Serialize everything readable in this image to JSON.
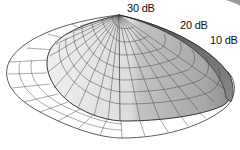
{
  "diagram": {
    "type": "3d-radiation-pattern",
    "labels": [
      {
        "text": "30 dB",
        "x": 127,
        "y": 2
      },
      {
        "text": "20 dB",
        "x": 180,
        "y": 19
      },
      {
        "text": "10 dB",
        "x": 210,
        "y": 34
      }
    ],
    "colors": {
      "outer_ring_fill": "#ffffff",
      "dome_light": "#e6e6e6",
      "dome_mid": "#c4c4c4",
      "dome_dark": "#8a8a8a",
      "rim_dark": "#606060",
      "grid_line": "#444444"
    }
  }
}
